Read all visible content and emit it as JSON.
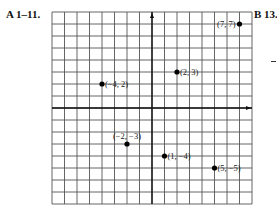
{
  "labels": {
    "left": "A 1–11.",
    "right": "B 13."
  },
  "chart_data": {
    "type": "scatter",
    "title": "",
    "xlabel": "",
    "ylabel": "",
    "xlim": [
      -8,
      8
    ],
    "ylim": [
      -8,
      8
    ],
    "grid": true,
    "points": [
      {
        "x": 7,
        "y": 7,
        "label": "(7, 7)",
        "label_side": "left"
      },
      {
        "x": -4,
        "y": 2,
        "label": "(−4, 2)",
        "label_side": "right"
      },
      {
        "x": 2,
        "y": 3,
        "label": "(2, 3)",
        "label_side": "right"
      },
      {
        "x": -2,
        "y": -3,
        "label": "(−2, −3)",
        "label_side": "above"
      },
      {
        "x": 1,
        "y": -4,
        "label": "(1, −4)",
        "label_side": "right"
      },
      {
        "x": 5,
        "y": -5,
        "label": "(5, −5)",
        "label_side": "right"
      }
    ]
  },
  "colors": {
    "grid": "#555555",
    "axis": "#111111",
    "point": "#000000"
  }
}
